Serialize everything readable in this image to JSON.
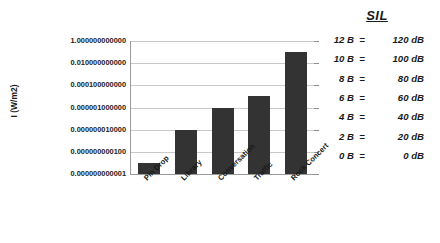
{
  "chart_data": {
    "type": "bar",
    "title": "",
    "xlabel": "",
    "ylabel": "I (W/m2)",
    "categories": [
      "Pin Drop",
      "Library",
      "Conversation",
      "Traffic",
      "Rock Concert"
    ],
    "values": [
      1e-11,
      1e-08,
      1e-06,
      1e-05,
      0.1
    ],
    "value_labels": [
      "0.000000000010",
      "0.000000010000",
      "0.000001000000",
      "0.000010000000",
      "0.100000000000"
    ],
    "yscale": "log",
    "ylim": [
      1e-12,
      1
    ],
    "ytick_labels": [
      "1.000000000000",
      "0.010000000000",
      "0.000100000000",
      "0.000001000000",
      "0.000000010000",
      "0.000000000100",
      "0.000000000001"
    ],
    "ytick_values": [
      1,
      0.01,
      0.0001,
      1e-06,
      1e-08,
      1e-10,
      1e-12
    ],
    "grid": true,
    "legend": "none",
    "bar_color": "#333333",
    "gridline_color": "#c9c9c9",
    "axis_color": "#9a9a9a"
  },
  "sil_table": {
    "title": "SIL",
    "rows": [
      {
        "bels": "12 B",
        "eq": "=",
        "db": "120 dB"
      },
      {
        "bels": "10 B",
        "eq": "=",
        "db": "100 dB"
      },
      {
        "bels": "8 B",
        "eq": "=",
        "db": "80 dB"
      },
      {
        "bels": "6 B",
        "eq": "=",
        "db": "60 dB"
      },
      {
        "bels": "4 B",
        "eq": "=",
        "db": "40 dB"
      },
      {
        "bels": "2 B",
        "eq": "=",
        "db": "20 dB"
      },
      {
        "bels": "0 B",
        "eq": "=",
        "db": "0 dB"
      }
    ]
  }
}
